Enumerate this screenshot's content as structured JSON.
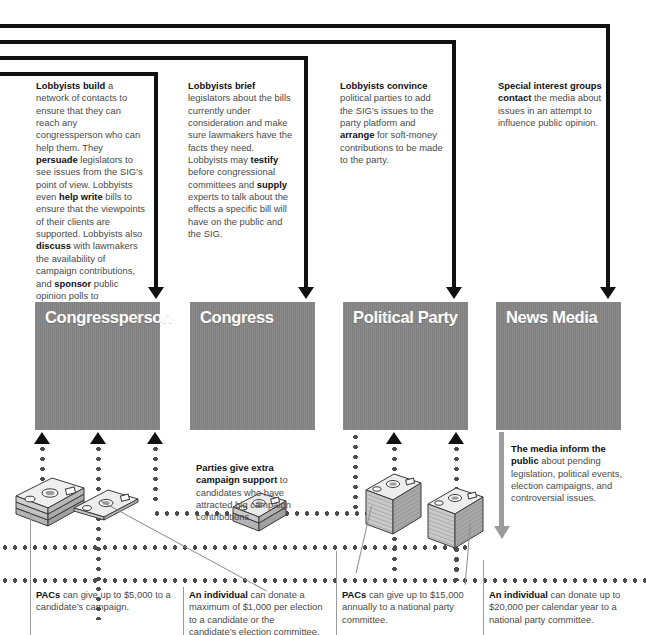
{
  "diagram": {
    "actors": [
      {
        "id": "congressperson",
        "label": "Congressperson"
      },
      {
        "id": "congress",
        "label": "Congress"
      },
      {
        "id": "political-party",
        "label": "Political Party"
      },
      {
        "id": "news-media",
        "label": "News Media"
      }
    ],
    "top_notes": [
      {
        "id": "note-congressperson",
        "html": "<b>Lobbyists build</b> a network of contacts to ensure that they can reach any congressperson who can help them. They <b>persuade</b> legislators to see issues from the SIG&rsquo;s point of view. Lobbyists even <b>help write</b> bills to ensure that the viewpoints of their clients are supported. Lobbyists also <b>discuss</b> with lawmakers the availability of campaign contributions, and <b>sponsor</b> public opinion polls to demonstrate support for the SIG&rsquo;s views."
      },
      {
        "id": "note-congress",
        "html": "<b>Lobbyists brief</b> legislators about the bills currently under consideration and make sure lawmakers have the facts they need. Lobbyists may <b>testify</b> before congressional committees and <b>supply</b> experts to talk about the effects a specific bill will have on the public and the SIG."
      },
      {
        "id": "note-political-party",
        "html": "<b>Lobbyists convince</b> political parties to add the SIG&rsquo;s issues to the party platform and <b>arrange</b> for soft-money contributions to be made to the party."
      },
      {
        "id": "note-news-media",
        "html": "<b>Special interest groups contact</b> the media about issues in an attempt to influence public opinion."
      }
    ],
    "mid_notes": [
      {
        "id": "note-party-support",
        "html": "<b>Parties give extra campaign support</b> to candidates who have attracted big campaign contributions."
      },
      {
        "id": "note-media-inform",
        "html": "<b>The media inform the public</b> about pending legislation, political events, election campaigns, and controversial issues."
      }
    ],
    "bottom_notes": [
      {
        "id": "note-pac-candidate",
        "html": "<b>PACs</b> can give up to $5,000 to a candidate&rsquo;s campaign."
      },
      {
        "id": "note-individual-candidate",
        "html": "<b>An individual</b> can donate a maximum of $1,000 per election to a candidate or the candidate&rsquo;s election committee."
      },
      {
        "id": "note-pac-party",
        "html": "<b>PACs</b> can give up to $15,000 annually to a national party committee."
      },
      {
        "id": "note-individual-party",
        "html": "<b>An individual</b> can donate up to $20,000 per calendar year to a national party committee."
      }
    ],
    "money_icons": [
      {
        "id": "cash-stack-pac-candidate",
        "type": "cash-stack-tall"
      },
      {
        "id": "cash-bill-individual-candidate",
        "type": "cash-bill-single"
      },
      {
        "id": "cash-bill-party-support",
        "type": "cash-stack-short"
      },
      {
        "id": "cash-stack-pac-party",
        "type": "cash-stack-tall"
      },
      {
        "id": "cash-stack-individual-party",
        "type": "cash-stack-tall"
      }
    ],
    "colors": {
      "actor_box": "#858585",
      "flow_line": "#111111",
      "money_line": "#4c4c4c",
      "media_arrow": "#9c9c9c",
      "body_text": "#4a4a4a",
      "label_text": "#ffffff"
    }
  }
}
